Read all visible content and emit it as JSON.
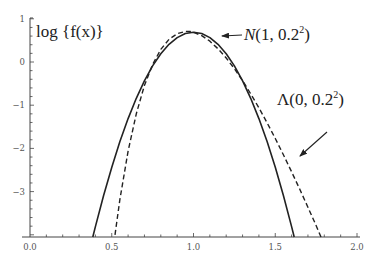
{
  "chart_data": {
    "type": "line",
    "title": "",
    "xlabel": "",
    "ylabel": "log {f(x)}",
    "xlim": [
      0.0,
      2.0
    ],
    "ylim": [
      -4.05,
      1.0
    ],
    "grid": false,
    "x_ticks": [
      "0.0",
      "0.5",
      "1.0",
      "1.5",
      "2.0"
    ],
    "x_tick_values": [
      0.0,
      0.5,
      1.0,
      1.5,
      2.0
    ],
    "y_ticks": [
      "1",
      "0",
      "−1",
      "−2",
      "−3"
    ],
    "y_tick_values": [
      1,
      0,
      -1,
      -2,
      -3
    ],
    "series": [
      {
        "name": "N(1, 0.2²)",
        "style": "solid",
        "x": [
          0.384,
          0.4,
          0.45,
          0.5,
          0.55,
          0.6,
          0.65,
          0.7,
          0.75,
          0.8,
          0.85,
          0.9,
          0.95,
          1.0,
          1.05,
          1.1,
          1.15,
          1.2,
          1.25,
          1.3,
          1.35,
          1.4,
          1.45,
          1.5,
          1.55,
          1.6,
          1.616
        ],
        "y": [
          -4.05,
          -3.81,
          -3.091,
          -2.435,
          -1.841,
          -1.31,
          -0.841,
          -0.435,
          -0.091,
          0.19,
          0.409,
          0.565,
          0.659,
          0.69,
          0.659,
          0.565,
          0.409,
          0.19,
          -0.091,
          -0.435,
          -0.841,
          -1.31,
          -1.841,
          -2.435,
          -3.091,
          -3.81,
          -4.05
        ]
      },
      {
        "name": "Λ(0, 0.2²)",
        "style": "dashed",
        "x": [
          0.52,
          0.55,
          0.6,
          0.65,
          0.7,
          0.75,
          0.8,
          0.85,
          0.9,
          0.95,
          0.98,
          1.0,
          1.05,
          1.1,
          1.15,
          1.2,
          1.25,
          1.3,
          1.35,
          1.4,
          1.45,
          1.5,
          1.55,
          1.6,
          1.65,
          1.7,
          1.75,
          1.78
        ],
        "y": [
          -4.0,
          -3.181,
          -2.063,
          -1.198,
          -0.544,
          -0.057,
          0.291,
          0.522,
          0.656,
          0.708,
          0.705,
          0.69,
          0.611,
          0.481,
          0.306,
          0.093,
          -0.155,
          -0.433,
          -0.736,
          -1.061,
          -1.408,
          -1.77,
          -2.149,
          -2.541,
          -2.946,
          -3.36,
          -3.785,
          -4.05
        ]
      }
    ],
    "annotations": [
      {
        "text": "N(1, 0.2²)",
        "series": 0,
        "arrow_to": [
          1.17,
          0.68
        ]
      },
      {
        "text": "Λ(0, 0.2²)",
        "series": 1,
        "arrow_to": [
          1.7,
          -3.0
        ]
      }
    ]
  },
  "labels": {
    "ylabel": "log {f(x)}",
    "normal_name": "N",
    "normal_args": "(1, 0.2",
    "lognormal_name": "Λ",
    "lognormal_args": "(0, 0.2",
    "sq": "2",
    "close": ")"
  },
  "colors": {
    "curve": "#222222",
    "axis": "#444444"
  }
}
